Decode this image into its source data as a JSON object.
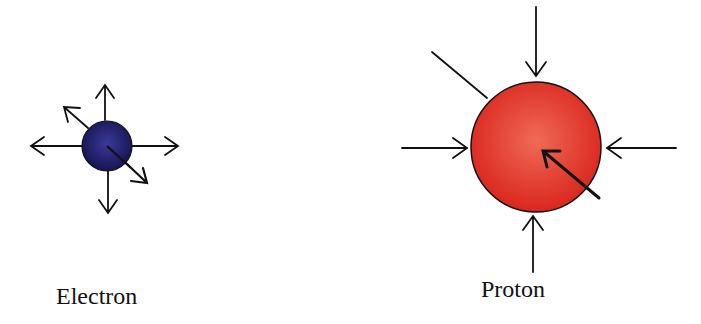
{
  "particles": [
    {
      "name": "electron",
      "label": "Electron",
      "color": "#1e1a66",
      "arrow_direction": "outward"
    },
    {
      "name": "proton",
      "label": "Proton",
      "color": "#e0281e",
      "arrow_direction": "inward"
    }
  ]
}
